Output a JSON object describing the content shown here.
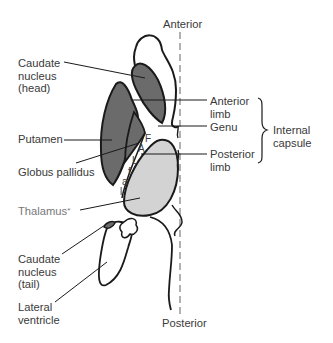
{
  "figure": {
    "orientation": {
      "top": "Anterior",
      "bottom": "Posterior"
    },
    "left_labels": {
      "caudate_head": "Caudate\nnucleus\n(head)",
      "putamen": "Putamen",
      "globus_pallidus": "Globus pallidus",
      "thalamus": "Thalamus",
      "thalamus_mark": "*",
      "caudate_tail": "Caudate\nnucleus\n(tail)",
      "lateral_ventricle": "Lateral\nventricle"
    },
    "right_labels": {
      "anterior_limb": "Anterior\nlimb",
      "genu": "Genu",
      "posterior_limb": "Posterior\nlimb",
      "internal_capsule": "Internal\ncapsule"
    },
    "fibre_letters": [
      "F",
      "A",
      "L",
      "f",
      "a",
      "l"
    ],
    "colors": {
      "dark_structure": "#6b6b6b",
      "thalamus_fill": "#d3d3d3",
      "outline": "#1a1a1a",
      "midline": "#888888",
      "text": "#3a3a3a"
    }
  }
}
